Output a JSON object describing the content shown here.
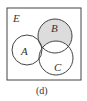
{
  "diagram": {
    "type": "venn",
    "universe_label": "E",
    "sets": [
      {
        "label": "A",
        "cx": 27,
        "cy": 50,
        "r": 15
      },
      {
        "label": "B",
        "cx": 55,
        "cy": 36,
        "r": 17
      },
      {
        "label": "C",
        "cx": 56,
        "cy": 58,
        "r": 17
      }
    ],
    "shaded_region": "B only (B ∩ A' ∩ C')",
    "shade_color": "#dcdcdc",
    "caption": "(d)"
  }
}
